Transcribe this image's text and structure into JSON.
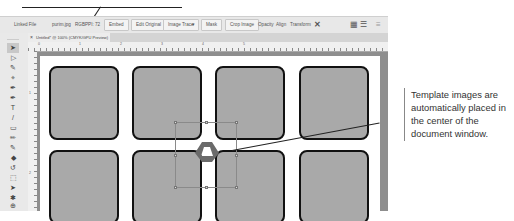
{
  "control_bar": {
    "linked_file_label": "Linked File",
    "file_name": "purim.jpg",
    "color_mode": "RGB",
    "ppi": "PPI: 72",
    "buttons": {
      "embed": "Embed",
      "edit_original": "Edit Original",
      "image_trace": "Image Trace",
      "mask": "Mask",
      "crop_image": "Crop Image",
      "opacity": "Opacity",
      "align": "Align",
      "transform": "Transform"
    },
    "icons": {
      "dropdown": "▾",
      "puppet_warp": "✕",
      "grid": "▦",
      "list": "☰",
      "menu": "≡"
    }
  },
  "document": {
    "tab_title": "Untitled* @ 100% (CMYK/GPU Preview)",
    "close_icon": "×"
  },
  "ruler": {
    "h_ticks": [
      "0",
      "1",
      "2",
      "3",
      "4",
      "5"
    ],
    "v_ticks": [
      "1",
      "2"
    ]
  },
  "tools": [
    "➤",
    "▷",
    "✎",
    "⌖",
    "✒",
    "✒",
    "T",
    "/",
    "▭",
    "✏",
    "✎",
    "◆",
    "↺",
    "⬚",
    "➤",
    "✱",
    "⊕"
  ],
  "callout": {
    "text": "Template images are automatically placed in the center of the document window."
  },
  "colors": {
    "square_fill": "#a9a9a9",
    "square_border": "#111111",
    "pasteboard": "#8e8e8e",
    "artboard": "#ffffff",
    "placed_shape": "#6a6a6a"
  }
}
